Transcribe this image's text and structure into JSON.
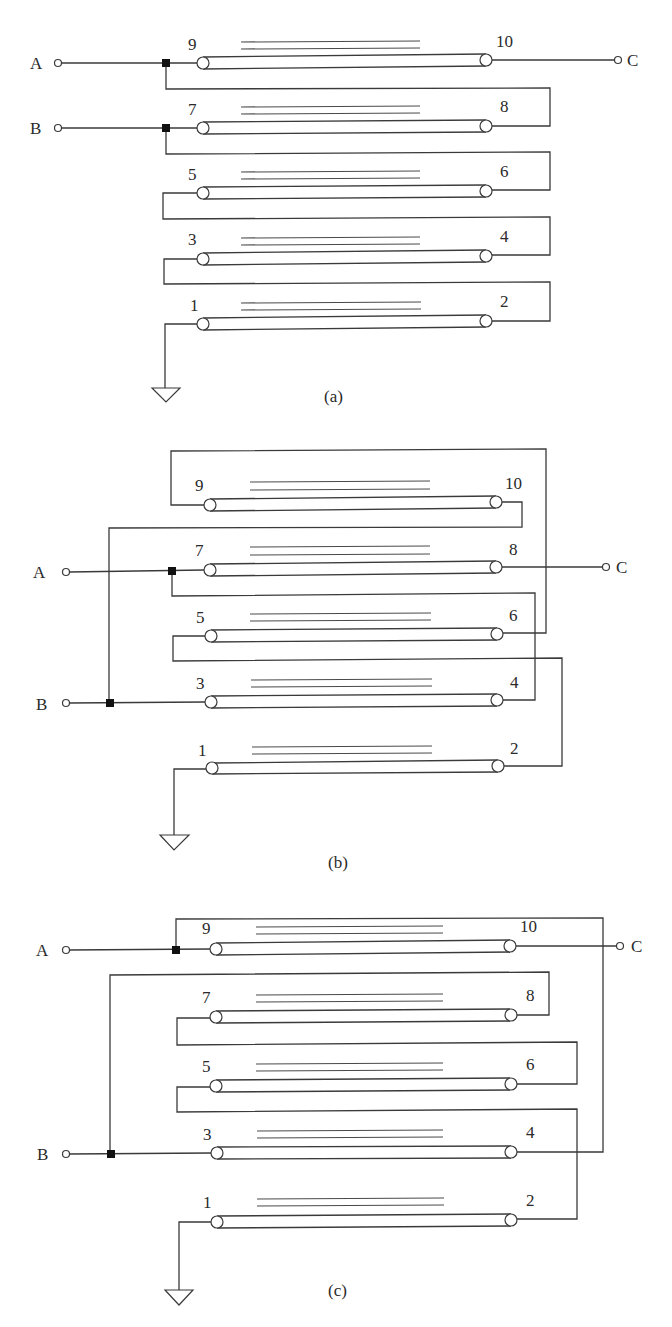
{
  "figure": {
    "type": "transmission-line-transformer-schematics",
    "colors": {
      "line": "#3a3a3a",
      "junction": "#111111",
      "background": "#ffffff"
    }
  },
  "terminals": {
    "a": "A",
    "b": "B",
    "c": "C"
  },
  "pin_labels": [
    "1",
    "2",
    "3",
    "4",
    "5",
    "6",
    "7",
    "8",
    "9",
    "10"
  ],
  "panels": [
    {
      "id": "a",
      "caption": "(a)",
      "description": "A feeds pin 9; pin 10 to C; B feeds pin 7; series chain 9-10? no: junction A loops to 8, junction B loops to 6, 5 loops to 4, 3 loops to 2, pin 1 to ground",
      "lines": [
        {
          "left_pin": "9",
          "right_pin": "10"
        },
        {
          "left_pin": "7",
          "right_pin": "8"
        },
        {
          "left_pin": "5",
          "right_pin": "6"
        },
        {
          "left_pin": "3",
          "right_pin": "4"
        },
        {
          "left_pin": "1",
          "right_pin": "2"
        }
      ]
    },
    {
      "id": "b",
      "caption": "(b)",
      "lines": [
        {
          "left_pin": "9",
          "right_pin": "10"
        },
        {
          "left_pin": "7",
          "right_pin": "8"
        },
        {
          "left_pin": "5",
          "right_pin": "6"
        },
        {
          "left_pin": "3",
          "right_pin": "4"
        },
        {
          "left_pin": "1",
          "right_pin": "2"
        }
      ]
    },
    {
      "id": "c",
      "caption": "(c)",
      "lines": [
        {
          "left_pin": "9",
          "right_pin": "10"
        },
        {
          "left_pin": "7",
          "right_pin": "8"
        },
        {
          "left_pin": "5",
          "right_pin": "6"
        },
        {
          "left_pin": "3",
          "right_pin": "4"
        },
        {
          "left_pin": "1",
          "right_pin": "2"
        }
      ]
    }
  ]
}
